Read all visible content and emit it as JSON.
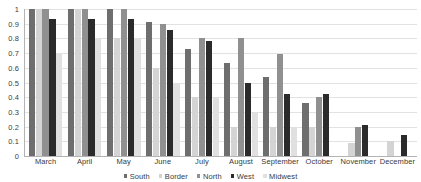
{
  "chart_data": {
    "type": "bar",
    "title": "",
    "xlabel": "",
    "ylabel": "",
    "ylim": [
      0,
      1
    ],
    "yticks": [
      "1",
      "0.9",
      "0.8",
      "0.7",
      "0.6",
      "0.5",
      "0.4",
      "0.3",
      "0.2",
      "0.1",
      "0"
    ],
    "ytick_values": [
      1,
      0.9,
      0.8,
      0.7,
      0.6,
      0.5,
      0.4,
      0.3,
      0.2,
      0.1,
      0
    ],
    "grid": true,
    "legend_position": "bottom",
    "categories": [
      "March",
      "April",
      "May",
      "June",
      "July",
      "August",
      "September",
      "October",
      "November",
      "December"
    ],
    "series": [
      {
        "name": "South",
        "color": "#6e6e6e",
        "values": [
          1.0,
          1.0,
          1.0,
          0.91,
          0.725,
          0.635,
          0.54,
          0.36,
          0,
          0
        ]
      },
      {
        "name": "Border",
        "color": "#d4d4d4",
        "values": [
          1.0,
          1.0,
          0.8,
          0.6,
          0.4,
          0.2,
          0.2,
          0.2,
          0.09,
          0.1
        ]
      },
      {
        "name": "North",
        "color": "#909090",
        "values": [
          1.0,
          1.0,
          1.0,
          0.9,
          0.8,
          0.8,
          0.695,
          0.4,
          0.2,
          0
        ]
      },
      {
        "name": "West",
        "color": "#2b2b2b",
        "values": [
          0.93,
          0.93,
          0.93,
          0.855,
          0.785,
          0.5,
          0.425,
          0.425,
          0.21,
          0.14
        ]
      },
      {
        "name": "Midwest",
        "color": "#e0e0e0",
        "values": [
          0.7,
          0.8,
          0.8,
          0.5,
          0.4,
          0.3,
          0.2,
          0,
          0,
          0
        ]
      }
    ]
  },
  "colors": {
    "gridline": "#e2e2e2",
    "axis": "#b4b4b4",
    "text": "#3a3a3a",
    "background": "#ffffff"
  }
}
